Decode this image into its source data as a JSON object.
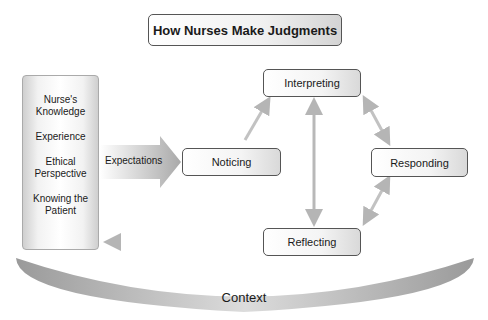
{
  "title": "How Nurses Make Judgments",
  "factors": [
    "Nurse's\nKnowledge",
    "Experience",
    "Ethical\nPerspective",
    "Knowing the\nPatient"
  ],
  "factor_lines": [
    [
      "Nurse's",
      "Knowledge"
    ],
    [
      "Experience"
    ],
    [
      "Ethical",
      "Perspective"
    ],
    [
      "Knowing the",
      "Patient"
    ]
  ],
  "expectations_label": "Expectations",
  "nodes": {
    "noticing": "Noticing",
    "interpreting": "Interpreting",
    "responding": "Responding",
    "reflecting": "Reflecting"
  },
  "context_label": "Context",
  "colors": {
    "arrow": "#b8b8b8",
    "border": "#555555",
    "context": "#a8a8a8"
  }
}
